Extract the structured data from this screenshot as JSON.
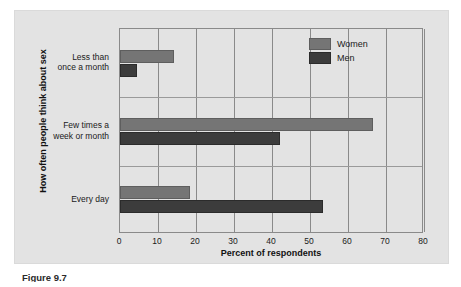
{
  "caption": "Figure 9.7",
  "legend": {
    "position": "top-right",
    "entries": [
      {
        "label": "Women",
        "color": "#757575",
        "swatch_name": "legend-swatch-women"
      },
      {
        "label": "Men",
        "color": "#3c3c3c",
        "swatch_name": "legend-swatch-men"
      }
    ]
  },
  "colors": {
    "panel_background": "#e3e3e3",
    "axis_line": "#8a8a8a",
    "women_bar": "#757575",
    "men_bar": "#3c3c3c",
    "text": "#1a1a1a"
  },
  "chart_data": {
    "type": "bar",
    "orientation": "horizontal",
    "title": "",
    "xlabel": "Percent of respondents",
    "ylabel": "How often people think about sex",
    "xlim": [
      0,
      80
    ],
    "xticks": [
      0,
      10,
      20,
      30,
      40,
      50,
      60,
      70,
      80
    ],
    "ticklabels": [
      "0",
      "10",
      "20",
      "30",
      "40",
      "50",
      "60",
      "70",
      "80"
    ],
    "grid": true,
    "grid_axis": "x",
    "legend_position": "top-right",
    "categories": [
      "Less than once a month",
      "Few times a week or month",
      "Every day"
    ],
    "category_label_lines": [
      [
        "Less than",
        "once a month"
      ],
      [
        "Few times a",
        "week or month"
      ],
      [
        "Every day"
      ]
    ],
    "series": [
      {
        "name": "Women",
        "color": "#757575",
        "values": [
          14.2,
          66.5,
          18.5
        ]
      },
      {
        "name": "Men",
        "color": "#3c3c3c",
        "values": [
          4.5,
          42.0,
          53.5
        ]
      }
    ]
  }
}
